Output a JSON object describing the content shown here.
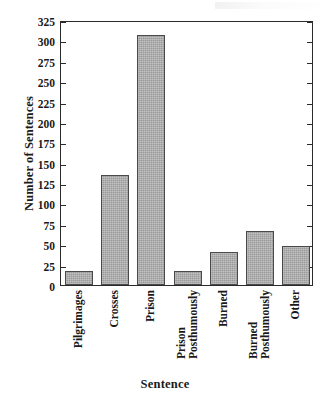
{
  "chart_data": {
    "type": "bar",
    "title": "",
    "xlabel": "Sentence",
    "ylabel": "Number of Sentences",
    "categories": [
      "Pilgrimages",
      "Crosses",
      "Prison",
      "Prison Posthumously",
      "Burned",
      "Burned Posthumously",
      "Other"
    ],
    "values": [
      17,
      135,
      307,
      17,
      41,
      66,
      48
    ],
    "ylim": [
      0,
      325
    ],
    "ytick_labels": [
      "0",
      "25",
      "50",
      "75",
      "100",
      "125",
      "150",
      "175",
      "200",
      "225",
      "250",
      "275",
      "300",
      "325"
    ],
    "ytick_values": [
      0,
      25,
      50,
      75,
      100,
      125,
      150,
      175,
      200,
      225,
      250,
      275,
      300,
      325
    ],
    "grid": false,
    "legend": null,
    "bar_color": "#a9a9a9",
    "bar_edge_color": "#4a4a4a",
    "axis_color": "#2b2b2b"
  },
  "axes": {
    "y_title": "Number of Sentences",
    "x_title": "Sentence"
  },
  "bars": [
    {
      "label": "Pilgrimages",
      "label_line1": "Pilgrimages",
      "label_line2": "",
      "value": 17
    },
    {
      "label": "Crosses",
      "label_line1": "Crosses",
      "label_line2": "",
      "value": 135
    },
    {
      "label": "Prison",
      "label_line1": "Prison",
      "label_line2": "",
      "value": 307
    },
    {
      "label": "Prison Posthumously",
      "label_line1": "Prison",
      "label_line2": "Posthumously",
      "value": 17
    },
    {
      "label": "Burned",
      "label_line1": "Burned",
      "label_line2": "",
      "value": 41
    },
    {
      "label": "Burned Posthumously",
      "label_line1": "Burned",
      "label_line2": "Posthumously",
      "value": 66
    },
    {
      "label": "Other",
      "label_line1": "Other",
      "label_line2": "",
      "value": 48
    }
  ]
}
